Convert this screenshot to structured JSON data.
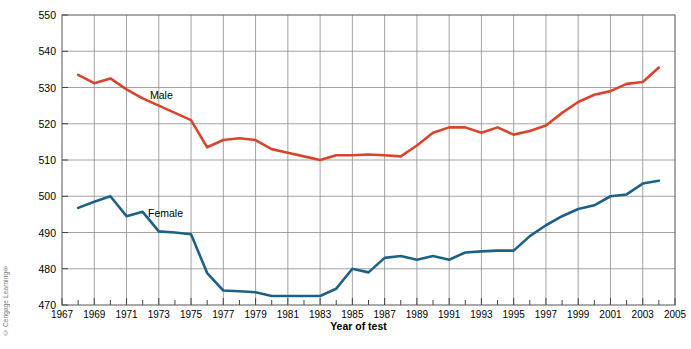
{
  "figure": {
    "credit": "© Cengage Learning®"
  },
  "chart_data": {
    "type": "line",
    "title": "",
    "xlabel": "Year of test",
    "ylabel": "Mean math SAT score",
    "xlim": [
      1967,
      2005
    ],
    "ylim": [
      470,
      550
    ],
    "grid": true,
    "legend_position": "inline-labels",
    "xticks": [
      1967,
      1969,
      1971,
      1973,
      1975,
      1977,
      1979,
      1981,
      1983,
      1985,
      1987,
      1989,
      1991,
      1993,
      1995,
      1997,
      1999,
      2001,
      2003,
      2005
    ],
    "yticks": [
      470,
      480,
      490,
      500,
      510,
      520,
      530,
      540,
      550
    ],
    "x": [
      1968,
      1969,
      1970,
      1971,
      1972,
      1973,
      1974,
      1975,
      1976,
      1977,
      1978,
      1979,
      1980,
      1981,
      1982,
      1983,
      1984,
      1985,
      1986,
      1987,
      1988,
      1989,
      1990,
      1991,
      1992,
      1993,
      1994,
      1995,
      1996,
      1997,
      1998,
      1999,
      2000,
      2001,
      2002,
      2003,
      2004
    ],
    "series": [
      {
        "name": "Male",
        "color": "#d8452d",
        "values": [
          533.5,
          531.2,
          532.5,
          529.5,
          527.0,
          525.0,
          523.0,
          521.0,
          513.5,
          515.5,
          516.0,
          515.5,
          513.0,
          512.0,
          511.0,
          510.0,
          511.3,
          511.3,
          511.5,
          511.3,
          511.0,
          514.0,
          517.5,
          519.0,
          519.0,
          517.5,
          519.0,
          517.0,
          518.0,
          519.5,
          523.0,
          526.0,
          528.0,
          529.0,
          531.0,
          531.5,
          535.5
        ],
        "inline_label": "Male"
      },
      {
        "name": "Female",
        "color": "#1e6187",
        "values": [
          496.8,
          498.5,
          500.0,
          494.5,
          495.7,
          490.3,
          490.0,
          489.5,
          478.8,
          474.0,
          473.8,
          473.5,
          472.5,
          472.5,
          472.5,
          472.5,
          474.5,
          480.0,
          479.0,
          483.0,
          483.5,
          482.5,
          483.5,
          482.5,
          484.5,
          484.8,
          485.0,
          485.0,
          489.0,
          492.0,
          494.5,
          496.5,
          497.5,
          500.0,
          500.5,
          503.5,
          504.3
        ],
        "inline_label": "Female"
      }
    ]
  }
}
